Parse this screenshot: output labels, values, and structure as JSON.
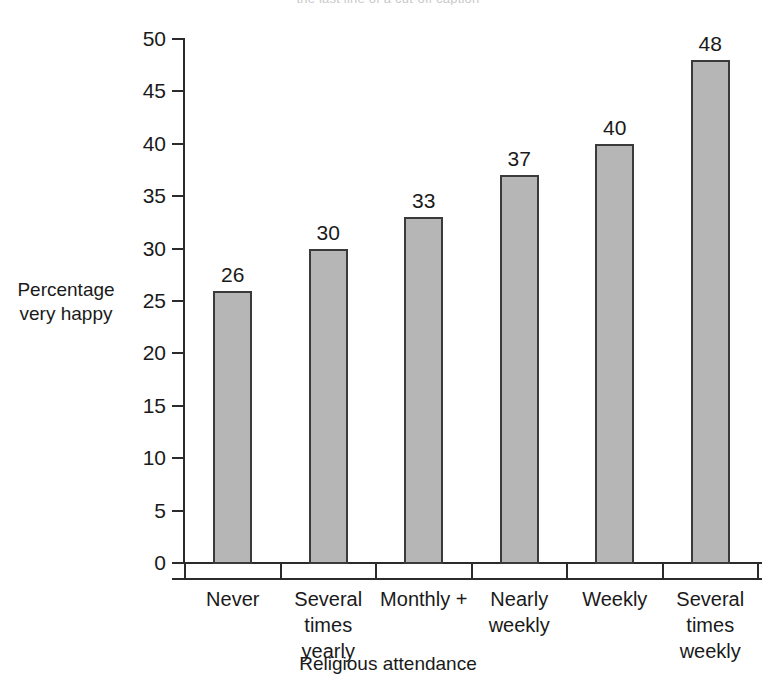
{
  "chart_data": {
    "type": "bar",
    "title": "",
    "xlabel": "Religious attendance",
    "ylabel": "Percentage very happy",
    "ylabel_lines": [
      "Percentage",
      "very happy"
    ],
    "categories": [
      "Never",
      "Several times yearly",
      "Monthly +",
      "Nearly weekly",
      "Weekly",
      "Several times weekly"
    ],
    "category_lines": [
      [
        "Never"
      ],
      [
        "Several",
        "times",
        "yearly"
      ],
      [
        "Monthly +"
      ],
      [
        "Nearly",
        "weekly"
      ],
      [
        "Weekly"
      ],
      [
        "Several",
        "times",
        "weekly"
      ]
    ],
    "values": [
      26,
      30,
      33,
      37,
      40,
      48
    ],
    "value_labels": [
      "26",
      "30",
      "33",
      "37",
      "40",
      "48"
    ],
    "ylim": [
      0,
      50
    ],
    "yticks": [
      0,
      5,
      10,
      15,
      20,
      25,
      30,
      35,
      40,
      45,
      50
    ],
    "ytick_labels": [
      "0",
      "5",
      "10",
      "15",
      "20",
      "25",
      "30",
      "35",
      "40",
      "45",
      "50"
    ],
    "grid": false,
    "legend": null,
    "bar_color": "#b6b6b6",
    "bar_edge_color": "#3a3a3a",
    "axis_color": "#2b2b2b"
  },
  "caption_sliver": "the last line of a cut-off caption"
}
